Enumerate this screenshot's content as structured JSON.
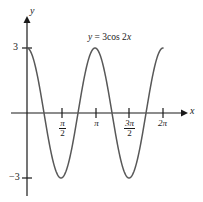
{
  "figure": {
    "kind": "cartesian-graph",
    "equation_label": {
      "lhs": "y",
      "eq": " = 3cos 2",
      "rhs": "x",
      "full": "y = 3cos 2x"
    },
    "axes": {
      "x_label": "x",
      "y_label": "y",
      "x_ticks": [
        {
          "name": "pi-over-2",
          "numerator": "π",
          "denominator": "2",
          "value": 1.5707963
        },
        {
          "name": "pi",
          "text": "π",
          "value": 3.1415927
        },
        {
          "name": "three-pi-over-2",
          "numerator": "3π",
          "denominator": "2",
          "value": 4.712389
        },
        {
          "name": "two-pi",
          "text": "2π",
          "value": 6.2831853
        }
      ],
      "y_ticks": [
        {
          "name": "y-three",
          "text": "3",
          "value": 3
        },
        {
          "name": "y-minus-three",
          "text": "−3",
          "value": -3
        }
      ]
    },
    "colors": {
      "curve": "#585858",
      "axis": "#1a1a1a",
      "text": "#1a1a1a",
      "background": "#ffffff"
    }
  },
  "chart_data": {
    "type": "line",
    "title": "",
    "subtitle": "",
    "xlabel": "x",
    "ylabel": "y",
    "annotations": [
      {
        "text": "y = 3cos 2x",
        "x": 3.4,
        "y": 3.9
      }
    ],
    "grid": false,
    "legend": null,
    "xlim": [
      -0.55,
      7.3
    ],
    "ylim": [
      -4.4,
      4.4
    ],
    "xticks": [
      1.5707963,
      3.1415927,
      4.712389,
      6.2831853
    ],
    "xticklabels": [
      "π/2",
      "π",
      "3π/2",
      "2π"
    ],
    "yticks": [
      3,
      -3
    ],
    "yticklabels": [
      "3",
      "−3"
    ],
    "series": [
      {
        "name": "y = 3cos 2x",
        "formula": "y = 3*cos(2*x)",
        "amplitude": 3,
        "period": 3.1415927,
        "frequency": 2,
        "phase": 0,
        "color": "#585858",
        "domain": [
          0,
          6.2831853
        ],
        "x": [
          0,
          0.3927,
          0.7854,
          1.1781,
          1.5708,
          1.9635,
          2.3562,
          2.7489,
          3.1416,
          3.5343,
          3.927,
          4.3197,
          4.7124,
          5.1051,
          5.4978,
          5.8905,
          6.2832
        ],
        "y": [
          3,
          2.1213,
          0,
          -2.1213,
          -3,
          -2.1213,
          0,
          2.1213,
          3,
          2.1213,
          0,
          -2.1213,
          -3,
          -2.1213,
          0,
          2.1213,
          3
        ],
        "maxima": [
          {
            "x": 0,
            "y": 3
          },
          {
            "x": 3.1415927,
            "y": 3
          },
          {
            "x": 6.2831853,
            "y": 3
          }
        ],
        "minima": [
          {
            "x": 1.5707963,
            "y": -3
          },
          {
            "x": 4.712389,
            "y": -3
          }
        ],
        "zeros": [
          0.7853982,
          2.3561945,
          3.9269908,
          5.4977871
        ]
      }
    ]
  }
}
